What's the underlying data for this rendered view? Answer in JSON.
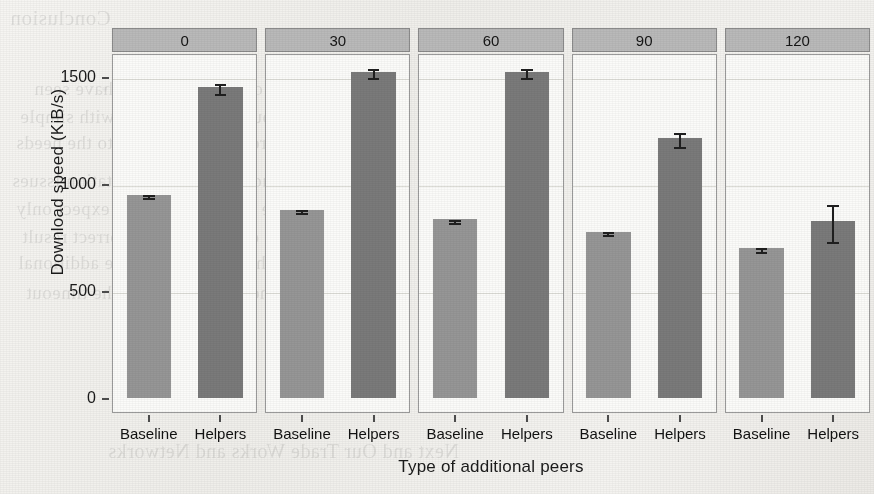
{
  "chart_data": {
    "type": "bar",
    "title": "",
    "xlabel": "Type of additional peers",
    "ylabel": "Download speed (KiB/s)",
    "categories": [
      "Baseline",
      "Helpers"
    ],
    "facet_label": "",
    "facets": [
      "0",
      "30",
      "60",
      "90",
      "120"
    ],
    "ylim": [
      0,
      1600
    ],
    "yticks": [
      0,
      500,
      1000,
      1500
    ],
    "ytick_labels": [
      "0",
      "500",
      "1000",
      "1500"
    ],
    "grid": true,
    "legend": "none",
    "colors": {
      "baseline_bar": "#969696",
      "helpers_bar": "#7a7a7a",
      "strip_background": "#b9b9b9",
      "panel_background": "#fbfbf9",
      "axis_text": "#1a1a1a",
      "error_bar": "#1f1f1f"
    },
    "panels": [
      {
        "facet": "0",
        "bars": [
          {
            "category": "Baseline",
            "value": 950,
            "error": 8
          },
          {
            "category": "Helpers",
            "value": 1453,
            "error": 25
          }
        ]
      },
      {
        "facet": "30",
        "bars": [
          {
            "category": "Baseline",
            "value": 880,
            "error": 8
          },
          {
            "category": "Helpers",
            "value": 1525,
            "error": 20
          }
        ]
      },
      {
        "facet": "60",
        "bars": [
          {
            "category": "Baseline",
            "value": 835,
            "error": 6
          },
          {
            "category": "Helpers",
            "value": 1525,
            "error": 22
          }
        ]
      },
      {
        "facet": "90",
        "bars": [
          {
            "category": "Baseline",
            "value": 778,
            "error": 7
          },
          {
            "category": "Helpers",
            "value": 1215,
            "error": 35
          }
        ]
      },
      {
        "facet": "120",
        "bars": [
          {
            "category": "Baseline",
            "value": 700,
            "error": 10
          },
          {
            "category": "Helpers",
            "value": 825,
            "error": 85
          }
        ]
      }
    ]
  },
  "background_text": {
    "note": "faint bleed-through text from reverse of scanned page",
    "lines": [
      {
        "text": "Conclusion",
        "x": 10,
        "y": 6,
        "size": 21
      },
      {
        "text": "In our evaluation we have seen",
        "x": 34,
        "y": 78,
        "size": 19
      },
      {
        "text": "we used in our measurements, with simple",
        "x": 20,
        "y": 106,
        "size": 19
      },
      {
        "text": "is a good result of the speed to the needs",
        "x": 16,
        "y": 132,
        "size": 19
      },
      {
        "text": "We have studied the implementation issues",
        "x": 12,
        "y": 170,
        "size": 19
      },
      {
        "text": "For large file sizes. We can expect only",
        "x": 16,
        "y": 198,
        "size": 19
      },
      {
        "text": "which does not have a correct result",
        "x": 22,
        "y": 226,
        "size": 19
      },
      {
        "text": "we can see that the performance additional",
        "x": 18,
        "y": 252,
        "size": 19
      },
      {
        "text": "the connection and the timeout",
        "x": 26,
        "y": 282,
        "size": 19
      },
      {
        "text": "Next and Our Trade Works and Networks",
        "x": 108,
        "y": 440,
        "size": 20
      }
    ]
  },
  "axis_geometry": {
    "y_pixel_at_zero": 399,
    "y_pixel_at_1500": 78,
    "plot_left": 112,
    "plot_right": 870
  }
}
